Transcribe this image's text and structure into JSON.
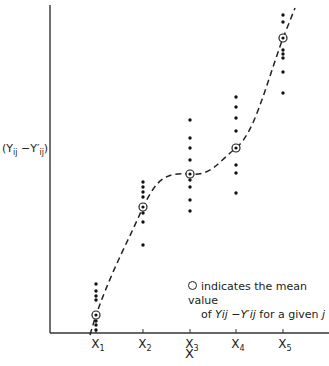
{
  "chart_data": {
    "type": "scatter",
    "title": "",
    "xlabel": "X",
    "ylabel": "(Y_ij - Y'_ij)",
    "ylabel_display": "(Yij −Y′ij)",
    "categories": [
      "X1",
      "X2",
      "X3",
      "X4",
      "X5"
    ],
    "grid": false,
    "legend_position": "lower right",
    "legend_text": [
      "indicates the mean value",
      "of Yij − Y′ij for a given j"
    ],
    "series": [
      {
        "name": "observations",
        "marker": "dot",
        "points_pixel_y": {
          "X1": [
            284,
            291,
            296,
            300,
            321,
            325,
            330
          ],
          "X2": [
            182,
            187,
            192,
            197,
            213,
            222,
            245
          ],
          "X3": [
            120,
            138,
            148,
            160,
            180,
            187,
            200,
            211
          ],
          "X4": [
            97,
            107,
            118,
            131,
            165,
            173,
            193
          ],
          "X5": [
            15,
            22,
            50,
            54,
            58,
            72,
            93
          ]
        }
      },
      {
        "name": "mean value",
        "marker": "circled-dot",
        "points_pixel_y": {
          "X1": 315,
          "X2": 207,
          "X3": 174,
          "X4": 148,
          "X5": 38
        }
      },
      {
        "name": "fitted curve",
        "style": "dashed",
        "shape": "cubic through means"
      }
    ],
    "axis": {
      "origin_px": [
        50,
        333
      ],
      "y_top_px": 5,
      "x_right_px": 329,
      "tick_x_px": {
        "X1": 96,
        "X2": 143,
        "X3": 190,
        "X4": 236,
        "X5": 283
      }
    }
  },
  "labels": {
    "ylabel_main": "(Y",
    "ylabel_sub1": "ij",
    "ylabel_mid": " −Y′",
    "ylabel_sub2": "ij",
    "ylabel_end": ")",
    "xlabel": "X",
    "tick_X": "X",
    "ticks": [
      "1",
      "2",
      "3",
      "4",
      "5"
    ],
    "legend_line1": "indicates the mean value",
    "legend_line2_pre": "of ",
    "legend_line2_expr": "Yij −Y′ij",
    "legend_line2_post": " for a given ",
    "legend_line2_j": "j"
  }
}
